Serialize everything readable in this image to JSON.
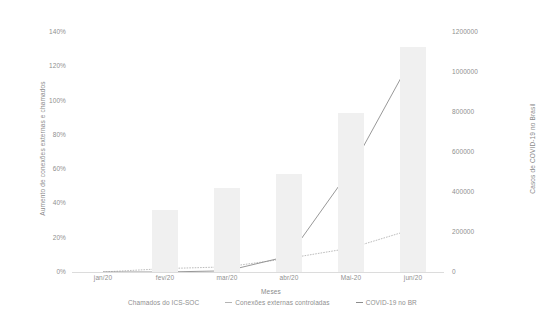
{
  "chart_data": {
    "type": "bar",
    "title": "",
    "xlabel": "Meses",
    "ylabel": "Aumento de conexões externas e chamados",
    "y2label": "Casos de COVID-19 no Brasil",
    "categories": [
      "jan/20",
      "fev/20",
      "mar/20",
      "abr/20",
      "Mai-20",
      "jun/20"
    ],
    "ylim": [
      0,
      140
    ],
    "y2lim": [
      0,
      1200000
    ],
    "yticks": [
      "0%",
      "20%",
      "40%",
      "60%",
      "80%",
      "100%",
      "120%",
      "140%"
    ],
    "ytick_values": [
      0,
      20,
      40,
      60,
      80,
      100,
      120,
      140
    ],
    "y2ticks": [
      "0",
      "200000",
      "400000",
      "600000",
      "800000",
      "1000000",
      "1200000"
    ],
    "y2tick_values": [
      0,
      200000,
      400000,
      600000,
      800000,
      1000000,
      1200000
    ],
    "grid": false,
    "legend_position": "bottom",
    "series": [
      {
        "name": "Chamados do ICS-SOC",
        "type": "bar",
        "axis": "left",
        "color": "#f0f0f0",
        "values": [
          0,
          36,
          49,
          57,
          93,
          131
        ]
      },
      {
        "name": "Conexões externas controladas",
        "type": "line",
        "axis": "left",
        "color": "#b4b4b4",
        "values": [
          0,
          2,
          3,
          8,
          14,
          25
        ]
      },
      {
        "name": "COVID-19 no BR",
        "type": "line",
        "axis": "right",
        "color": "#8c8c8c",
        "values": [
          0,
          0,
          6000,
          80000,
          515000,
          1080000
        ]
      }
    ]
  },
  "legend": {
    "items": [
      {
        "label": "Chamados do ICS-SOC",
        "marker": "bar"
      },
      {
        "label": "Conexões externas controladas",
        "marker": "line"
      },
      {
        "label": "COVID-19 no BR",
        "marker": "line"
      }
    ]
  }
}
